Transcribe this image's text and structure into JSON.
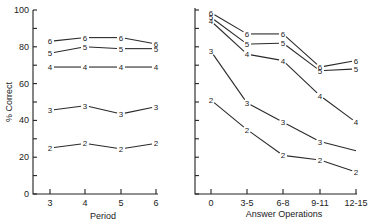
{
  "chart_data": [
    {
      "type": "line",
      "title": "",
      "xlabel": "Period",
      "ylabel": "% Correct",
      "ylim": [
        0,
        100
      ],
      "yticks": [
        0,
        20,
        40,
        60,
        80,
        100
      ],
      "grid": false,
      "categories": [
        "3",
        "4",
        "5",
        "6"
      ],
      "series": [
        {
          "name": "6",
          "values": [
            83,
            85,
            85,
            81.5
          ]
        },
        {
          "name": "5",
          "values": [
            76.5,
            80,
            79,
            79
          ]
        },
        {
          "name": "4",
          "values": [
            69,
            69,
            69,
            69
          ]
        },
        {
          "name": "3",
          "values": [
            45.5,
            48,
            43.5,
            47.5
          ]
        },
        {
          "name": "2",
          "values": [
            25,
            27.5,
            24.5,
            27.5
          ]
        }
      ]
    },
    {
      "type": "line",
      "title": "",
      "xlabel": "Answer Operations",
      "ylabel": "",
      "ylim": [
        0,
        100
      ],
      "grid": false,
      "categories": [
        "0",
        "3-5",
        "6-8",
        "9-11",
        "12-15"
      ],
      "series": [
        {
          "name": "6",
          "values": [
            98.5,
            87,
            87,
            69,
            72.5
          ]
        },
        {
          "name": "5",
          "values": [
            96,
            81.5,
            82,
            67,
            68
          ]
        },
        {
          "name": "4",
          "values": [
            94,
            76,
            72.5,
            53.5,
            39
          ]
        },
        {
          "name": "3",
          "values": [
            77.5,
            49.5,
            39,
            28.5,
            23.5
          ],
          "unlabeled_last_point": true
        },
        {
          "name": "2",
          "values": [
            51,
            35,
            21,
            18.5,
            12
          ]
        }
      ]
    }
  ],
  "labels": {
    "left_xlabel": "Period",
    "right_xlabel": "Answer Operations",
    "ylabel": "% Correct"
  }
}
